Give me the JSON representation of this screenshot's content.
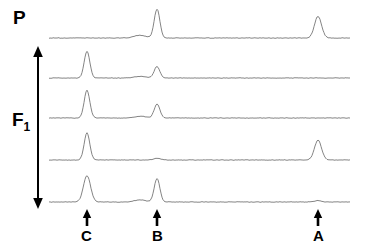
{
  "figure": {
    "title_label_projection": "P",
    "axis_label_f1": "F",
    "axis_label_f1_subscript": "1",
    "background_color": "#ffffff",
    "trace_color": "#6e6e6e",
    "marker_color": "#000000",
    "plot_left": 49,
    "plot_right": 350,
    "peak_positions": {
      "C": 87,
      "B": 157,
      "A": 318
    }
  },
  "markers": [
    {
      "name": "marker-c",
      "label": "C",
      "x": 87
    },
    {
      "name": "marker-b",
      "label": "B",
      "x": 157
    },
    {
      "name": "marker-a",
      "label": "A",
      "x": 318
    }
  ],
  "chart_data": {
    "type": "line",
    "xlabel": "",
    "ylabel": "",
    "grid": false,
    "legend": "none",
    "xlim": [
      49,
      350
    ],
    "peak_label_positions": {
      "C": 87,
      "B": 157,
      "A": 318
    },
    "series": [
      {
        "name": "P (projection)",
        "row": 0,
        "baseline_y": 38,
        "peaks": [
          {
            "label": "C",
            "x": 87,
            "height": 0.0,
            "width": 4
          },
          {
            "label": "pre-B-bump",
            "x": 140,
            "height": 0.09,
            "width": 8
          },
          {
            "label": "B",
            "x": 157,
            "height": 0.96,
            "width": 4
          },
          {
            "label": "A",
            "x": 318,
            "height": 0.72,
            "width": 5
          }
        ]
      },
      {
        "name": "slice 1",
        "row": 1,
        "baseline_y": 78,
        "peaks": [
          {
            "label": "C",
            "x": 87,
            "height": 0.88,
            "width": 4
          },
          {
            "label": "pre-B-bump",
            "x": 140,
            "height": 0.05,
            "width": 8
          },
          {
            "label": "B",
            "x": 157,
            "height": 0.38,
            "width": 4
          },
          {
            "label": "A",
            "x": 318,
            "height": 0.0,
            "width": 5
          }
        ]
      },
      {
        "name": "slice 2",
        "row": 2,
        "baseline_y": 118,
        "peaks": [
          {
            "label": "C",
            "x": 87,
            "height": 0.92,
            "width": 4
          },
          {
            "label": "pre-B-bump",
            "x": 140,
            "height": 0.06,
            "width": 8
          },
          {
            "label": "B",
            "x": 157,
            "height": 0.46,
            "width": 4
          },
          {
            "label": "A",
            "x": 318,
            "height": 0.0,
            "width": 5
          }
        ]
      },
      {
        "name": "slice 3",
        "row": 3,
        "baseline_y": 160,
        "peaks": [
          {
            "label": "C",
            "x": 87,
            "height": 0.9,
            "width": 4
          },
          {
            "label": "B",
            "x": 157,
            "height": 0.06,
            "width": 5
          },
          {
            "label": "A",
            "x": 318,
            "height": 0.66,
            "width": 5
          }
        ]
      },
      {
        "name": "slice 4",
        "row": 4,
        "baseline_y": 202,
        "peaks": [
          {
            "label": "C",
            "x": 87,
            "height": 0.88,
            "width": 5
          },
          {
            "label": "pre-B-bump",
            "x": 140,
            "height": 0.07,
            "width": 8
          },
          {
            "label": "B",
            "x": 157,
            "height": 0.78,
            "width": 4
          },
          {
            "label": "A",
            "x": 318,
            "height": 0.05,
            "width": 5
          }
        ]
      }
    ]
  }
}
